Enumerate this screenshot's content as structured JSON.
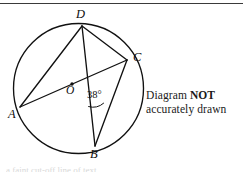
{
  "page": {
    "width": 243,
    "height": 172,
    "background": "#ffffff",
    "rule_color": "#3a3a3a"
  },
  "note": {
    "line1_prefix": "Diagram ",
    "line1_emphasis": "NOT",
    "line2": "accurately drawn"
  },
  "figure": {
    "stroke_color": "#111111",
    "circle": {
      "cx": 78.5,
      "cy": 88.5,
      "r": 65
    },
    "center_dot": {
      "cx": 72,
      "cy": 84,
      "r": 1.6
    },
    "vertices": {
      "A": {
        "label": "A",
        "x": 20,
        "y": 107,
        "label_x": 8,
        "label_y": 108
      },
      "B": {
        "label": "B",
        "x": 95,
        "y": 146,
        "label_x": 90,
        "label_y": 148
      },
      "C": {
        "label": "C",
        "x": 127,
        "y": 60,
        "label_x": 133,
        "label_y": 51
      },
      "D": {
        "label": "D",
        "x": 82,
        "y": 26,
        "label_x": 76,
        "label_y": 8
      },
      "O": {
        "label": "O",
        "x": 72,
        "y": 84,
        "label_x": 66,
        "label_y": 85
      }
    },
    "chords": [
      {
        "name": "A-C",
        "from": "A",
        "to": "C"
      },
      {
        "name": "A-D",
        "from": "A",
        "to": "D"
      },
      {
        "name": "D-B",
        "from": "D",
        "to": "B"
      },
      {
        "name": "D-C",
        "from": "D",
        "to": "C"
      },
      {
        "name": "C-B",
        "from": "C",
        "to": "B"
      }
    ],
    "angle": {
      "value": "38",
      "unit": "°",
      "text": "38°",
      "at_vertex": "B",
      "between": [
        "B-D",
        "B-C"
      ],
      "label_x": 87,
      "label_y": 90
    }
  },
  "bottom_caption": "a faint cut-off line of text"
}
